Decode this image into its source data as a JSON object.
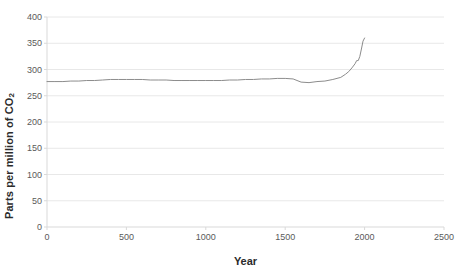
{
  "chart_data": {
    "type": "line",
    "title": "",
    "xlabel": "Year",
    "ylabel": "Parts per million of CO2",
    "ylabel_base": "Parts per million of CO",
    "ylabel_sub": "2",
    "xlim": [
      0,
      2500
    ],
    "ylim": [
      0,
      400
    ],
    "xticks": [
      0,
      500,
      1000,
      1500,
      2000,
      2500
    ],
    "xtick_labels": [
      "0",
      "500",
      "1000",
      "1500",
      "2000",
      "2500"
    ],
    "yticks": [
      0,
      50,
      100,
      150,
      200,
      250,
      300,
      350,
      400
    ],
    "ytick_labels": [
      "0",
      "50",
      "100",
      "150",
      "200",
      "250",
      "300",
      "350",
      "400"
    ],
    "grid": true,
    "grid_axis": "y",
    "grid_color": "#e8e8e8",
    "legend": false,
    "line_color": "#8c8c8c",
    "line_width": 1,
    "series": [
      {
        "name": "Atmospheric CO2 concentration",
        "x": [
          0,
          50,
          100,
          150,
          200,
          250,
          300,
          350,
          400,
          450,
          500,
          550,
          600,
          650,
          700,
          750,
          800,
          850,
          900,
          950,
          1000,
          1050,
          1100,
          1150,
          1200,
          1250,
          1300,
          1350,
          1400,
          1450,
          1500,
          1550,
          1600,
          1650,
          1700,
          1750,
          1800,
          1850,
          1880,
          1900,
          1920,
          1940,
          1950,
          1960,
          1970,
          1980,
          1990,
          2000
        ],
        "values": [
          277,
          277,
          277,
          278,
          278,
          279,
          279,
          280,
          281,
          281,
          281,
          281,
          281,
          280,
          280,
          280,
          279,
          279,
          279,
          279,
          279,
          279,
          279,
          280,
          280,
          281,
          281,
          282,
          282,
          283,
          283,
          282,
          276,
          275,
          277,
          278,
          281,
          285,
          291,
          296,
          303,
          311,
          317,
          317,
          325,
          339,
          354,
          360
        ]
      }
    ]
  },
  "axes": {
    "year_label": "Year"
  }
}
